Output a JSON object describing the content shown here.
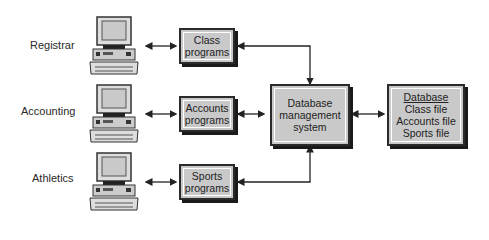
{
  "users": [
    {
      "label": "Registrar"
    },
    {
      "label": "Accounting"
    },
    {
      "label": "Athletics"
    }
  ],
  "programs": [
    {
      "line1": "Class",
      "line2": "programs"
    },
    {
      "line1": "Accounts",
      "line2": "programs"
    },
    {
      "line1": "Sports",
      "line2": "programs"
    }
  ],
  "dbms": {
    "line1": "Database",
    "line2": "management",
    "line3": "system"
  },
  "database": {
    "title": "Database",
    "files": [
      "Class file",
      "Accounts file",
      "Sports file"
    ]
  },
  "colors": {
    "box_fill": "#c9c9c9",
    "outline": "#2a2a2a",
    "background": "#ffffff"
  }
}
